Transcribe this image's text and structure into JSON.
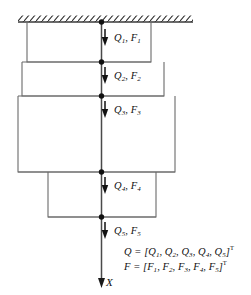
{
  "figure": {
    "support": {
      "name": "fixed-support-hatching",
      "description": "hatched ground / fixed boundary at top"
    },
    "axis": {
      "label": "X",
      "direction": "downward"
    },
    "colors": {
      "line": "#4a4a4a",
      "outline": "#6b6b6b",
      "node": "#111111",
      "arrow": "#111111",
      "background": "#ffffff"
    },
    "nodes": [
      {
        "id": 1,
        "label_Q": "Q",
        "label_F": "F",
        "index": "1"
      },
      {
        "id": 2,
        "label_Q": "Q",
        "label_F": "F",
        "index": "2"
      },
      {
        "id": 3,
        "label_Q": "Q",
        "label_F": "F",
        "index": "3"
      },
      {
        "id": 4,
        "label_Q": "Q",
        "label_F": "F",
        "index": "4"
      },
      {
        "id": 5,
        "label_Q": "Q",
        "label_F": "F",
        "index": "5"
      }
    ],
    "force_labels": [
      {
        "name": "force-label-1",
        "q": "Q",
        "qs": "1",
        "f": "F",
        "fs": "1"
      },
      {
        "name": "force-label-2",
        "q": "Q",
        "qs": "2",
        "f": "F",
        "fs": "2"
      },
      {
        "name": "force-label-3",
        "q": "Q",
        "qs": "3",
        "f": "F",
        "fs": "3"
      },
      {
        "name": "force-label-4",
        "q": "Q",
        "qs": "4",
        "f": "F",
        "fs": "4"
      },
      {
        "name": "force-label-5",
        "q": "Q",
        "qs": "5",
        "f": "F",
        "fs": "5"
      }
    ],
    "equations": {
      "q_vector": {
        "lhs": "Q",
        "eq": "=",
        "open": "[",
        "terms": [
          "Q",
          "Q",
          "Q",
          "Q",
          "Q"
        ],
        "subs": [
          "1",
          "2",
          "3",
          "4",
          "5"
        ],
        "close": "]",
        "transpose": "T"
      },
      "f_vector": {
        "lhs": "F",
        "eq": "=",
        "open": "[",
        "terms": [
          "F",
          "F",
          "F",
          "F",
          "F"
        ],
        "subs": [
          "1",
          "2",
          "3",
          "4",
          "5"
        ],
        "close": "]",
        "transpose": "T"
      }
    },
    "segments": [
      {
        "id": 1,
        "left": 27,
        "right": 151,
        "top": 22,
        "bottom": 62
      },
      {
        "id": 2,
        "left": 22,
        "right": 164,
        "top": 62,
        "bottom": 96
      },
      {
        "id": 3,
        "left": 18,
        "right": 175,
        "top": 96,
        "bottom": 172
      },
      {
        "id": 4,
        "left": 48,
        "right": 156,
        "top": 172,
        "bottom": 217
      }
    ]
  }
}
